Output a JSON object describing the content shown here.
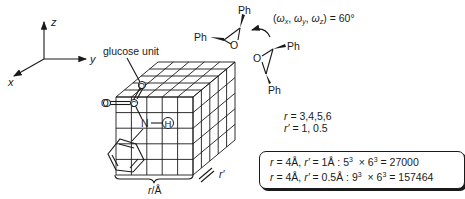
{
  "axes": {
    "x_label": "x",
    "y_label": "y",
    "z_label": "z"
  },
  "cube": {
    "label_glucose": "glucose unit",
    "atom_O_top": "O",
    "atom_O_left": "O",
    "atom_C": "C",
    "atom_N": "N",
    "atom_H": "H",
    "dimension_r": "r/Å",
    "dimension_r_prime": "r′",
    "grid_divisions": 5
  },
  "epoxide": {
    "ph_label": "Ph",
    "o_label": "O",
    "rotation_text": "(ωx, ωy, ωz) = 60°",
    "rotation_prefix": "(ω",
    "rotation_sub_x": "x",
    "rotation_sub_y": "y",
    "rotation_sub_z": "z",
    "rotation_suffix": ") = 60°"
  },
  "parameters": {
    "r_line": "r = 3,4,5,6",
    "r_prime_line": "r′ = 1, 0.5",
    "r_values": [
      3,
      4,
      5,
      6
    ],
    "r_prime_values": [
      1,
      0.5
    ]
  },
  "results_box": {
    "rows": [
      {
        "r": "4Å",
        "r_prime": "1Å",
        "expr_base1": "5",
        "expr_base2": "6",
        "exp": "3",
        "result": "27000"
      },
      {
        "r": "4Å",
        "r_prime": "0.5Å",
        "expr_base1": "9",
        "expr_base2": "6",
        "exp": "3",
        "result": "157464"
      }
    ]
  }
}
